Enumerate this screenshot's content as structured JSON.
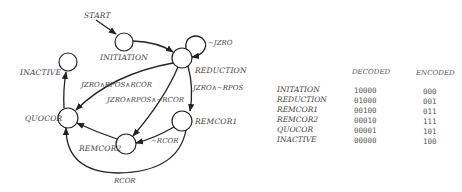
{
  "diagram": {
    "start_label": "START",
    "states": [
      {
        "id": "initiation",
        "label": "INITIATION",
        "cx": 124,
        "cy": 42,
        "r": 9
      },
      {
        "id": "reduction",
        "label": "REDUCTION",
        "cx": 182,
        "cy": 58,
        "r": 10
      },
      {
        "id": "inactive",
        "label": "INACTIVE",
        "cx": 68,
        "cy": 62,
        "r": 9
      },
      {
        "id": "quocor",
        "label": "QUOCOR",
        "cx": 68,
        "cy": 118,
        "r": 10
      },
      {
        "id": "remcor2",
        "label": "REMCOR2",
        "cx": 126,
        "cy": 144,
        "r": 10
      },
      {
        "id": "remcor1",
        "label": "REMCOR1",
        "cx": 182,
        "cy": 121,
        "r": 10
      }
    ],
    "transitions": [
      {
        "from": "START",
        "to": "INITIATION",
        "label": ""
      },
      {
        "from": "INITIATION",
        "to": "REDUCTION",
        "label": ""
      },
      {
        "from": "REDUCTION",
        "to": "REDUCTION",
        "label": "~JZRO"
      },
      {
        "from": "REDUCTION",
        "to": "QUOCOR",
        "label": "JZRO∧RPOS∧RCOR"
      },
      {
        "from": "REDUCTION",
        "to": "REMCOR2",
        "label": "JZRO∧RPOS∧~RCOR"
      },
      {
        "from": "REDUCTION",
        "to": "REMCOR1",
        "label": "JZRO∧~RPOS"
      },
      {
        "from": "REMCOR1",
        "to": "REMCOR2",
        "label": "~RCOR"
      },
      {
        "from": "REMCOR1",
        "to": "QUOCOR",
        "label": "RCOR"
      },
      {
        "from": "REMCOR2",
        "to": "QUOCOR",
        "label": ""
      },
      {
        "from": "QUOCOR",
        "to": "INACTIVE",
        "label": ""
      }
    ]
  },
  "table": {
    "headers": {
      "decoded": "DECODED",
      "encoded": "ENCODED"
    },
    "rows": [
      {
        "state": "INITATION",
        "decoded": "10000",
        "encoded": "000"
      },
      {
        "state": "REDUCTION",
        "decoded": "01000",
        "encoded": "001"
      },
      {
        "state": "REMCOR1",
        "decoded": "00100",
        "encoded": "011"
      },
      {
        "state": "REMCOR2",
        "decoded": "00010",
        "encoded": "111"
      },
      {
        "state": "QUOCOR",
        "decoded": "00001",
        "encoded": "101"
      },
      {
        "state": "INACTIVE",
        "decoded": "00000",
        "encoded": "100"
      }
    ]
  }
}
